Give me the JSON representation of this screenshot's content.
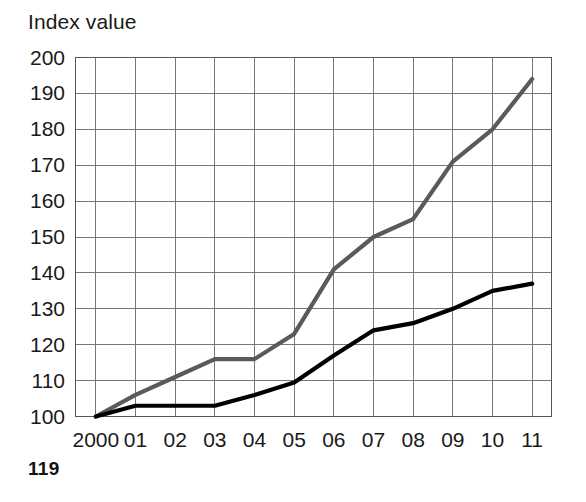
{
  "chart_data": {
    "type": "line",
    "title": "Index value",
    "xlabel": "",
    "ylabel": "",
    "x": [
      "2000",
      "01",
      "02",
      "03",
      "04",
      "05",
      "06",
      "07",
      "08",
      "09",
      "10",
      "11"
    ],
    "categories": [
      "2000",
      "01",
      "02",
      "03",
      "04",
      "05",
      "06",
      "07",
      "08",
      "09",
      "10",
      "11"
    ],
    "series": [
      {
        "name": "gray-series",
        "color": "#5a5a5a",
        "values": [
          100,
          106,
          111,
          116,
          116,
          123,
          141,
          150,
          155,
          171,
          180,
          194
        ]
      },
      {
        "name": "black-series",
        "color": "#000000",
        "values": [
          100,
          103,
          103,
          103,
          106,
          109.5,
          117,
          124,
          126,
          130,
          135,
          137
        ]
      }
    ],
    "ylim": [
      100,
      200
    ],
    "ytick_values": [
      100,
      110,
      120,
      130,
      140,
      150,
      160,
      170,
      180,
      190,
      200
    ],
    "ytick_labels": [
      "100",
      "110",
      "120",
      "130",
      "140",
      "150",
      "160",
      "170",
      "180",
      "190",
      "200"
    ],
    "xtick_labels": [
      "2000",
      "01",
      "02",
      "03",
      "04",
      "05",
      "06",
      "07",
      "08",
      "09",
      "10",
      "11"
    ],
    "grid": true,
    "grid_color": "#777777",
    "legend": "none",
    "legend_position": "none"
  },
  "page": {
    "number": "119"
  }
}
